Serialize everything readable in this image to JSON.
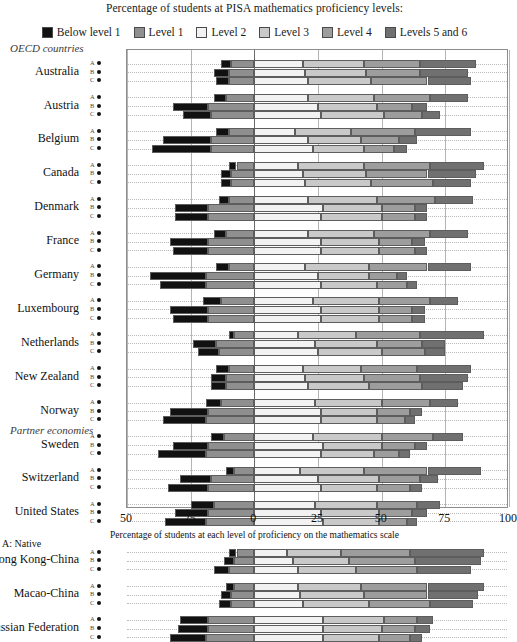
{
  "header": {
    "legend_title": "Percentage of students at PISA mathematics proficiency levels:"
  },
  "sections": {
    "oecd": "OECD countries",
    "partner": "Partner economies"
  },
  "axis": {
    "xlabel": "Percentage of students at each level of proficiency on the mathematics scale",
    "ticks": [
      "50",
      "25",
      "0",
      "25",
      "50",
      "75",
      "100"
    ]
  },
  "footnote": "A: Native",
  "row_codes": [
    "A",
    "B",
    "C"
  ],
  "colors": {
    "below_level_1": "#111111",
    "level_1": "#8f8f8f",
    "level_2": "#f2f2f2",
    "level_3": "#c9c9c9",
    "level_4": "#9d9d9d",
    "levels_5_and_6": "#707070",
    "frame": "#8d8d8d",
    "gridline": "#b4b4b4",
    "zeroline": "#6a6a6a"
  },
  "chart_data": {
    "type": "bar",
    "title": "Percentage of students at PISA mathematics proficiency levels:",
    "xlabel": "Percentage of students at each level of proficiency on the mathematics scale",
    "ylabel": "",
    "orientation": "horizontal",
    "stacked": true,
    "diverging": true,
    "grid": true,
    "legend_position": "top",
    "xlim": [
      -50,
      100
    ],
    "xticks": [
      -50,
      -25,
      0,
      25,
      50,
      75,
      100
    ],
    "xticklabels": [
      "50",
      "25",
      "0",
      "25",
      "50",
      "75",
      "100"
    ],
    "legend": [
      "Below level 1",
      "Level 1",
      "Level 2",
      "Level 3",
      "Level 4",
      "Levels 5 and 6"
    ],
    "note": "Negative side stacks Level 1 then Below level 1 leftward from 0; positive side stacks Level 2, Level 3, Level 4, Levels 5 and 6 rightward from 0.",
    "groups": [
      {
        "section": "OECD countries",
        "categories": [
          {
            "label": "Australia",
            "rows": [
              {
                "code": "A",
                "below_level_1": 4.0,
                "level_1": 9.0,
                "level_2": 19.0,
                "level_3": 24.0,
                "level_4": 22.0,
                "levels_5_and_6": 22.0
              },
              {
                "code": "B",
                "below_level_1": 6.0,
                "level_1": 10.0,
                "level_2": 20.0,
                "level_3": 24.0,
                "level_4": 21.0,
                "levels_5_and_6": 19.0
              },
              {
                "code": "C",
                "below_level_1": 5.0,
                "level_1": 10.0,
                "level_2": 21.0,
                "level_3": 25.0,
                "level_4": 22.0,
                "levels_5_and_6": 17.0
              }
            ]
          },
          {
            "label": "Austria",
            "rows": [
              {
                "code": "A",
                "below_level_1": 5.0,
                "level_1": 11.0,
                "level_2": 21.0,
                "level_3": 26.0,
                "level_4": 22.0,
                "levels_5_and_6": 15.0
              },
              {
                "code": "B",
                "below_level_1": 14.0,
                "level_1": 18.0,
                "level_2": 25.0,
                "level_3": 23.0,
                "level_4": 14.0,
                "levels_5_and_6": 6.0
              },
              {
                "code": "C",
                "below_level_1": 11.0,
                "level_1": 17.0,
                "level_2": 26.0,
                "level_3": 25.0,
                "level_4": 15.0,
                "levels_5_and_6": 7.0
              }
            ]
          },
          {
            "label": "Belgium",
            "rows": [
              {
                "code": "A",
                "below_level_1": 5.0,
                "level_1": 10.0,
                "level_2": 16.0,
                "level_3": 22.0,
                "level_4": 25.0,
                "levels_5_and_6": 22.0
              },
              {
                "code": "B",
                "below_level_1": 19.0,
                "level_1": 17.0,
                "level_2": 21.0,
                "level_3": 21.0,
                "level_4": 15.0,
                "levels_5_and_6": 7.0
              },
              {
                "code": "C",
                "below_level_1": 23.0,
                "level_1": 17.0,
                "level_2": 23.0,
                "level_3": 20.0,
                "level_4": 12.0,
                "levels_5_and_6": 5.0
              }
            ]
          },
          {
            "label": "Canada",
            "rows": [
              {
                "code": "A",
                "below_level_1": 3.0,
                "level_1": 7.0,
                "level_2": 17.0,
                "level_3": 26.0,
                "level_4": 26.0,
                "levels_5_and_6": 21.0
              },
              {
                "code": "B",
                "below_level_1": 4.0,
                "level_1": 9.0,
                "level_2": 19.0,
                "level_3": 25.0,
                "level_4": 24.0,
                "levels_5_and_6": 19.0
              },
              {
                "code": "C",
                "below_level_1": 4.0,
                "level_1": 9.0,
                "level_2": 20.0,
                "level_3": 26.0,
                "level_4": 24.0,
                "levels_5_and_6": 15.0
              }
            ]
          },
          {
            "label": "Denmark",
            "rows": [
              {
                "code": "A",
                "below_level_1": 4.0,
                "level_1": 10.0,
                "level_2": 21.0,
                "level_3": 27.0,
                "level_4": 23.0,
                "levels_5_and_6": 15.0
              },
              {
                "code": "B",
                "below_level_1": 13.0,
                "level_1": 18.0,
                "level_2": 27.0,
                "level_3": 23.0,
                "level_4": 13.0,
                "levels_5_and_6": 5.0
              },
              {
                "code": "C",
                "below_level_1": 13.0,
                "level_1": 18.0,
                "level_2": 26.0,
                "level_3": 24.0,
                "level_4": 13.0,
                "levels_5_and_6": 5.0
              }
            ]
          },
          {
            "label": "France",
            "rows": [
              {
                "code": "A",
                "below_level_1": 5.0,
                "level_1": 11.0,
                "level_2": 21.0,
                "level_3": 26.0,
                "level_4": 22.0,
                "levels_5_and_6": 15.0
              },
              {
                "code": "B",
                "below_level_1": 15.0,
                "level_1": 18.0,
                "level_2": 26.0,
                "level_3": 23.0,
                "level_4": 13.0,
                "levels_5_and_6": 5.0
              },
              {
                "code": "C",
                "below_level_1": 14.0,
                "level_1": 18.0,
                "level_2": 26.0,
                "level_3": 23.0,
                "level_4": 14.0,
                "levels_5_and_6": 5.0
              }
            ]
          },
          {
            "label": "Germany",
            "rows": [
              {
                "code": "A",
                "below_level_1": 5.0,
                "level_1": 10.0,
                "level_2": 20.0,
                "level_3": 25.0,
                "level_4": 23.0,
                "levels_5_and_6": 17.0
              },
              {
                "code": "B",
                "below_level_1": 22.0,
                "level_1": 19.0,
                "level_2": 25.0,
                "level_3": 20.0,
                "level_4": 11.0,
                "levels_5_and_6": 4.0
              },
              {
                "code": "C",
                "below_level_1": 18.0,
                "level_1": 19.0,
                "level_2": 26.0,
                "level_3": 22.0,
                "level_4": 12.0,
                "levels_5_and_6": 4.0
              }
            ]
          },
          {
            "label": "Luxembourg",
            "rows": [
              {
                "code": "A",
                "below_level_1": 7.0,
                "level_1": 13.0,
                "level_2": 23.0,
                "level_3": 26.0,
                "level_4": 20.0,
                "levels_5_and_6": 11.0
              },
              {
                "code": "B",
                "below_level_1": 15.0,
                "level_1": 18.0,
                "level_2": 26.0,
                "level_3": 23.0,
                "level_4": 13.0,
                "levels_5_and_6": 5.0
              },
              {
                "code": "C",
                "below_level_1": 14.0,
                "level_1": 18.0,
                "level_2": 26.0,
                "level_3": 23.0,
                "level_4": 13.0,
                "levels_5_and_6": 5.0
              }
            ]
          },
          {
            "label": "Netherlands",
            "rows": [
              {
                "code": "A",
                "below_level_1": 2.0,
                "level_1": 8.0,
                "level_2": 17.0,
                "level_3": 23.0,
                "level_4": 25.0,
                "levels_5_and_6": 25.0
              },
              {
                "code": "B",
                "below_level_1": 9.0,
                "level_1": 15.0,
                "level_2": 24.0,
                "level_3": 24.0,
                "level_4": 18.0,
                "levels_5_and_6": 9.0
              },
              {
                "code": "C",
                "below_level_1": 8.0,
                "level_1": 14.0,
                "level_2": 25.0,
                "level_3": 25.0,
                "level_4": 17.0,
                "levels_5_and_6": 8.0
              }
            ]
          },
          {
            "label": "New Zealand",
            "rows": [
              {
                "code": "A",
                "below_level_1": 5.0,
                "level_1": 10.0,
                "level_2": 19.0,
                "level_3": 23.0,
                "level_4": 22.0,
                "levels_5_and_6": 21.0
              },
              {
                "code": "B",
                "below_level_1": 6.0,
                "level_1": 11.0,
                "level_2": 20.0,
                "level_3": 23.0,
                "level_4": 22.0,
                "levels_5_and_6": 19.0
              },
              {
                "code": "C",
                "below_level_1": 6.0,
                "level_1": 11.0,
                "level_2": 21.0,
                "level_3": 24.0,
                "level_4": 21.0,
                "levels_5_and_6": 16.0
              }
            ]
          },
          {
            "label": "Norway",
            "rows": [
              {
                "code": "A",
                "below_level_1": 6.0,
                "level_1": 13.0,
                "level_2": 24.0,
                "level_3": 26.0,
                "level_4": 19.0,
                "levels_5_and_6": 11.0
              },
              {
                "code": "B",
                "below_level_1": 15.0,
                "level_1": 18.0,
                "level_2": 26.0,
                "level_3": 22.0,
                "level_4": 13.0,
                "levels_5_and_6": 5.0
              },
              {
                "code": "C",
                "below_level_1": 17.0,
                "level_1": 19.0,
                "level_2": 26.0,
                "level_3": 22.0,
                "level_4": 11.0,
                "levels_5_and_6": 4.0
              }
            ]
          },
          {
            "label": "Sweden",
            "rows": [
              {
                "code": "A",
                "below_level_1": 5.0,
                "level_1": 12.0,
                "level_2": 23.0,
                "level_3": 27.0,
                "level_4": 20.0,
                "levels_5_and_6": 12.0
              },
              {
                "code": "B",
                "below_level_1": 14.0,
                "level_1": 18.0,
                "level_2": 27.0,
                "level_3": 23.0,
                "level_4": 13.0,
                "levels_5_and_6": 5.0
              },
              {
                "code": "C",
                "below_level_1": 19.0,
                "level_1": 19.0,
                "level_2": 26.0,
                "level_3": 21.0,
                "level_4": 10.0,
                "levels_5_and_6": 4.0
              }
            ]
          },
          {
            "label": "Switzerland",
            "rows": [
              {
                "code": "A",
                "below_level_1": 3.0,
                "level_1": 8.0,
                "level_2": 18.0,
                "level_3": 25.0,
                "level_4": 25.0,
                "levels_5_and_6": 21.0
              },
              {
                "code": "B",
                "below_level_1": 12.0,
                "level_1": 17.0,
                "level_2": 25.0,
                "level_3": 24.0,
                "level_4": 16.0,
                "levels_5_and_6": 7.0
              },
              {
                "code": "C",
                "below_level_1": 16.0,
                "level_1": 18.0,
                "level_2": 26.0,
                "level_3": 22.0,
                "level_4": 13.0,
                "levels_5_and_6": 5.0
              }
            ]
          },
          {
            "label": "United States",
            "rows": [
              {
                "code": "A",
                "below_level_1": 9.0,
                "level_1": 16.0,
                "level_2": 24.0,
                "level_3": 24.0,
                "level_4": 16.0,
                "levels_5_and_6": 9.0
              },
              {
                "code": "B",
                "below_level_1": 13.0,
                "level_1": 18.0,
                "level_2": 26.0,
                "level_3": 23.0,
                "level_4": 13.0,
                "levels_5_and_6": 6.0
              },
              {
                "code": "C",
                "below_level_1": 16.0,
                "level_1": 19.0,
                "level_2": 27.0,
                "level_3": 22.0,
                "level_4": 11.0,
                "levels_5_and_6": 4.0
              }
            ]
          }
        ]
      },
      {
        "section": "Partner economies",
        "categories": [
          {
            "label": "Hong Kong-China",
            "rows": [
              {
                "code": "A",
                "below_level_1": 3.0,
                "level_1": 7.0,
                "level_2": 13.0,
                "level_3": 21.0,
                "level_4": 27.0,
                "levels_5_and_6": 29.0
              },
              {
                "code": "B",
                "below_level_1": 4.0,
                "level_1": 8.0,
                "level_2": 15.0,
                "level_3": 22.0,
                "level_4": 26.0,
                "levels_5_and_6": 26.0
              },
              {
                "code": "C",
                "below_level_1": 6.0,
                "level_1": 10.0,
                "level_2": 17.0,
                "level_3": 23.0,
                "level_4": 24.0,
                "levels_5_and_6": 21.0
              }
            ]
          },
          {
            "label": "Macao-China",
            "rows": [
              {
                "code": "A",
                "below_level_1": 3.0,
                "level_1": 8.0,
                "level_2": 17.0,
                "level_3": 25.0,
                "level_4": 26.0,
                "levels_5_and_6": 22.0
              },
              {
                "code": "B",
                "below_level_1": 4.0,
                "level_1": 9.0,
                "level_2": 18.0,
                "level_3": 25.0,
                "level_4": 25.0,
                "levels_5_and_6": 20.0
              },
              {
                "code": "C",
                "below_level_1": 5.0,
                "level_1": 9.0,
                "level_2": 19.0,
                "level_3": 26.0,
                "level_4": 24.0,
                "levels_5_and_6": 17.0
              }
            ]
          },
          {
            "label": "Russian Federation",
            "rows": [
              {
                "code": "A",
                "below_level_1": 11.0,
                "level_1": 18.0,
                "level_2": 27.0,
                "level_3": 24.0,
                "level_4": 13.0,
                "levels_5_and_6": 6.0
              },
              {
                "code": "B",
                "below_level_1": 12.0,
                "level_1": 18.0,
                "level_2": 27.0,
                "level_3": 23.0,
                "level_4": 13.0,
                "levels_5_and_6": 6.0
              },
              {
                "code": "C",
                "below_level_1": 14.0,
                "level_1": 19.0,
                "level_2": 27.0,
                "level_3": 22.0,
                "level_4": 12.0,
                "levels_5_and_6": 5.0
              }
            ]
          }
        ]
      }
    ]
  }
}
